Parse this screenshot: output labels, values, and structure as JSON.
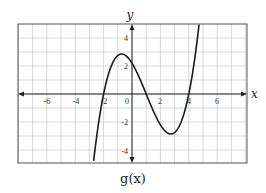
{
  "chart_data": {
    "type": "line",
    "title": "",
    "caption": "g(x)",
    "xlabel": "x",
    "ylabel": "y",
    "xlim": [
      -8,
      8
    ],
    "ylim": [
      -5,
      5
    ],
    "grid": true,
    "grid_step": 1,
    "x_ticks": [
      -6,
      -4,
      -2,
      0,
      2,
      4,
      6
    ],
    "x_tick_labels": [
      "-6",
      "-4",
      "-2",
      "0",
      "2",
      "4",
      "6"
    ],
    "y_ticks": [
      -4,
      -2,
      2,
      4
    ],
    "y_tick_labels": [
      "-4",
      "-2",
      "2",
      "4"
    ],
    "series": [
      {
        "name": "g(x)",
        "function": "0.275*(x+2)*(x-1)*(x-4)",
        "roots": [
          -2,
          1,
          4
        ],
        "y_intercept": 2.2,
        "local_max": [
          -0.65,
          2.6
        ],
        "local_min": [
          2.65,
          -2.6
        ],
        "x": [
          -2.8,
          -2.5,
          -2,
          -1.5,
          -1,
          -0.65,
          0,
          0.5,
          1,
          1.5,
          2,
          2.65,
          3,
          3.5,
          4,
          4.5,
          4.8
        ],
        "y": [
          -5.0,
          -2.8,
          0,
          1.61,
          2.48,
          2.6,
          2.2,
          1.29,
          0,
          -1.29,
          -2.2,
          -2.6,
          -2.48,
          -1.61,
          0,
          2.8,
          5.0
        ]
      }
    ],
    "legend": null
  },
  "labels": {
    "x_axis": "x",
    "y_axis": "y",
    "caption": "g(x)",
    "ticks": {
      "xn6": "-6",
      "xn4": "-4",
      "xn2": "-2",
      "x0": "0",
      "x2": "2",
      "x4": "4",
      "x6": "6",
      "y4": "4",
      "y2": "2",
      "yn2": "-2",
      "yn4": "-4"
    }
  },
  "colors": {
    "grid": "#c8c8c8",
    "frame": "#555555",
    "axis": "#222222",
    "curve": "#1a1a1a"
  }
}
